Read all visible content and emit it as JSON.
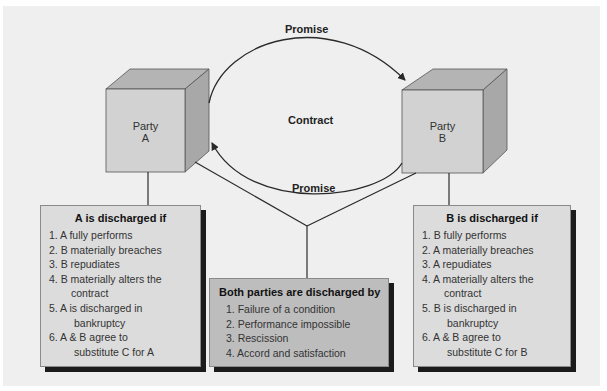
{
  "diagram": {
    "contract_label": "Contract",
    "promise_top": "Promise",
    "promise_bottom": "Promise",
    "party_a": {
      "line1": "Party",
      "line2": "A"
    },
    "party_b": {
      "line1": "Party",
      "line2": "B"
    }
  },
  "box_a": {
    "title": "A is discharged if",
    "items": [
      {
        "num": "1.",
        "text": "A fully performs",
        "cont": ""
      },
      {
        "num": "2.",
        "text": "B materially breaches",
        "cont": ""
      },
      {
        "num": "3.",
        "text": "B repudiates",
        "cont": ""
      },
      {
        "num": "4.",
        "text": "B materially alters the",
        "cont": "contract"
      },
      {
        "num": "5.",
        "text": "A is discharged in",
        "cont": "bankruptcy"
      },
      {
        "num": "6.",
        "text": "A & B agree to",
        "cont": "substitute C for A"
      }
    ]
  },
  "box_both": {
    "title": "Both parties are discharged by",
    "items": [
      {
        "num": "1.",
        "text": "Failure of a condition"
      },
      {
        "num": "2.",
        "text": "Performance impossible"
      },
      {
        "num": "3.",
        "text": "Rescission"
      },
      {
        "num": "4.",
        "text": "Accord and satisfaction"
      }
    ]
  },
  "box_b": {
    "title": "B is discharged if",
    "items": [
      {
        "num": "1.",
        "text": "B fully performs",
        "cont": ""
      },
      {
        "num": "2.",
        "text": "A materially breaches",
        "cont": ""
      },
      {
        "num": "3.",
        "text": "A repudiates",
        "cont": ""
      },
      {
        "num": "4.",
        "text": "A materially alters the",
        "cont": "contract"
      },
      {
        "num": "5.",
        "text": "B is discharged in",
        "cont": "bankruptcy"
      },
      {
        "num": "6.",
        "text": "A & B agree to",
        "cont": "substitute C for B"
      }
    ]
  },
  "colors": {
    "panel": "#efefef",
    "cube_front": "#d2d2d2",
    "cube_top": "#b4b4b4",
    "cube_side": "#a8a8a8",
    "side_box": "#dcdcdc",
    "center_box": "#bdbdbd",
    "shadow": "#1b1b1b",
    "line": "#2a2a2a"
  }
}
